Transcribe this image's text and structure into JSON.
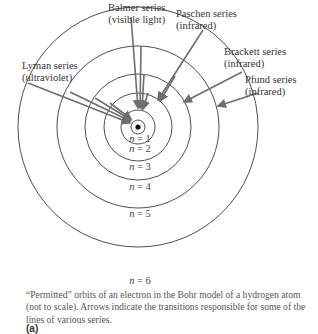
{
  "figure": {
    "type": "Bohr model of hydrogen atom",
    "orbits": [
      {
        "n": 1,
        "label_var": "n",
        "label_eq": "= 1"
      },
      {
        "n": 2,
        "label_var": "n",
        "label_eq": "= 2"
      },
      {
        "n": 3,
        "label_var": "n",
        "label_eq": "= 3"
      },
      {
        "n": 4,
        "label_var": "n",
        "label_eq": "= 4"
      },
      {
        "n": 5,
        "label_var": "n",
        "label_eq": "= 5"
      },
      {
        "n": 6,
        "label_var": "n",
        "label_eq": "= 6"
      }
    ],
    "series": [
      {
        "name": "Balmer series",
        "region": "(visible light)"
      },
      {
        "name": "Paschen series",
        "region": "(infrared)"
      },
      {
        "name": "Brackett series",
        "region": "(infrared)"
      },
      {
        "name": "Pfund series",
        "region": "(infrared)"
      },
      {
        "name": "Lyman series",
        "region": "(ultraviolet)"
      }
    ],
    "colors": {
      "orbit": "#3a3a3a",
      "arrow": "#6e6e6e",
      "text": "#333333"
    }
  },
  "caption": "“Permitted” orbits of an electron in the Bohr model of a hydrogen atom (not to scale). Arrows indicate the transitions responsible for some of the lines of various series.",
  "part_label": "(a)"
}
